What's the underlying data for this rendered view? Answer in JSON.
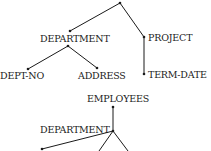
{
  "diagram": {
    "tree1": {
      "labels": {
        "department": "DEPARTMENT",
        "project": "PROJECT",
        "dept_no": "DEPT-NO",
        "address": "ADDRESS",
        "term_date": "TERM-DATE"
      }
    },
    "tree2": {
      "labels": {
        "employees": "EMPLOYEES",
        "department": "DEPARTMENT"
      }
    }
  }
}
